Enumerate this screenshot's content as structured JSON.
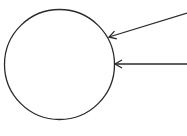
{
  "diagram": {
    "type": "circle-with-incoming-arrows",
    "width": 187,
    "height": 136,
    "background": "#ffffff",
    "stroke_color": "#2a2a2a",
    "circle": {
      "cx": 59.5,
      "cy": 64.5,
      "r": 55
    },
    "arrows": [
      {
        "name": "upper-arrow",
        "from": [
          187,
          13
        ],
        "to": [
          109,
          37
        ],
        "head": "open"
      },
      {
        "name": "lower-arrow",
        "from": [
          187,
          64
        ],
        "to": [
          115,
          64
        ],
        "head": "open"
      }
    ]
  }
}
